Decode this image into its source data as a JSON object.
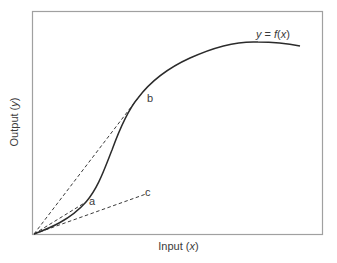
{
  "diagram": {
    "curve_label_prefix": "y",
    "curve_label_middle": " = ",
    "curve_label_func": "f",
    "curve_label_open": "(",
    "curve_label_var": "x",
    "curve_label_close": ")",
    "x_axis": {
      "text": "Input (",
      "var": "x",
      "close": ")"
    },
    "y_axis": {
      "text": "Output (",
      "var": "y",
      "close": ")"
    },
    "points": [
      {
        "id": "a",
        "label": "a"
      },
      {
        "id": "b",
        "label": "b"
      },
      {
        "id": "c",
        "label": "c"
      }
    ],
    "colors": {
      "curve": "#2b2b2b",
      "dashed": "#3a3a3a",
      "frame": "#9a9a9a",
      "text": "#3a3a3a"
    }
  }
}
